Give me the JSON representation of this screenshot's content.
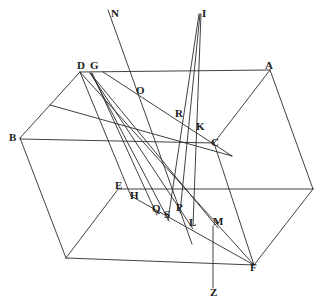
{
  "figure": {
    "kind": "geometric-diagram",
    "width": 329,
    "height": 305,
    "background_color": "#ffffff",
    "stroke_color": "#2b2b2b",
    "label_color": "#1a1a1a",
    "stroke_width": 0.9
  },
  "chart_data": {
    "type": "scatter",
    "title": "",
    "xlabel": "",
    "ylabel": "",
    "grid": false,
    "legend": null,
    "xlim": [
      0,
      329
    ],
    "ylim": [
      0,
      305
    ],
    "note": "Labelled points of the construction, coordinates in image pixel space (y grows downward)",
    "categories": [
      "N",
      "I",
      "D",
      "G",
      "A",
      "O",
      "R",
      "K",
      "C",
      "B",
      "E",
      "H",
      "Q",
      "S",
      "P",
      "L",
      "M",
      "F",
      "Z"
    ],
    "values": [
      {
        "name": "N",
        "x": 112,
        "y": 14
      },
      {
        "name": "I",
        "x": 202,
        "y": 14
      },
      {
        "name": "D",
        "x": 82,
        "y": 66
      },
      {
        "name": "G",
        "x": 95,
        "y": 66
      },
      {
        "name": "A",
        "x": 270,
        "y": 66
      },
      {
        "name": "O",
        "x": 140,
        "y": 91
      },
      {
        "name": "R",
        "x": 180,
        "y": 114
      },
      {
        "name": "K",
        "x": 199,
        "y": 128
      },
      {
        "name": "C",
        "x": 214,
        "y": 143
      },
      {
        "name": "B",
        "x": 16,
        "y": 139
      },
      {
        "name": "E",
        "x": 120,
        "y": 186
      },
      {
        "name": "H",
        "x": 134,
        "y": 197
      },
      {
        "name": "Q",
        "x": 157,
        "y": 210
      },
      {
        "name": "S",
        "x": 168,
        "y": 216
      },
      {
        "name": "P",
        "x": 180,
        "y": 209
      },
      {
        "name": "L",
        "x": 193,
        "y": 224
      },
      {
        "name": "M",
        "x": 218,
        "y": 223
      },
      {
        "name": "F",
        "x": 254,
        "y": 268
      },
      {
        "name": "Z",
        "x": 214,
        "y": 294
      }
    ]
  },
  "labels": [
    {
      "id": "label-n",
      "text": "N",
      "x": 111,
      "y": 8,
      "name": "point-label-n"
    },
    {
      "id": "label-i",
      "text": "I",
      "x": 202,
      "y": 8,
      "name": "point-label-i"
    },
    {
      "id": "label-d",
      "text": "D",
      "x": 77,
      "y": 60,
      "name": "point-label-d"
    },
    {
      "id": "label-g",
      "text": "G",
      "x": 90,
      "y": 60,
      "name": "point-label-g"
    },
    {
      "id": "label-a",
      "text": "A",
      "x": 265,
      "y": 60,
      "name": "point-label-a"
    },
    {
      "id": "label-o",
      "text": "O",
      "x": 136,
      "y": 85,
      "name": "point-label-o"
    },
    {
      "id": "label-r",
      "text": "R",
      "x": 175,
      "y": 108,
      "name": "point-label-r"
    },
    {
      "id": "label-k",
      "text": "K",
      "x": 196,
      "y": 121,
      "name": "point-label-k"
    },
    {
      "id": "label-c",
      "text": "C",
      "x": 211,
      "y": 137,
      "name": "point-label-c"
    },
    {
      "id": "label-b",
      "text": "B",
      "x": 9,
      "y": 132,
      "name": "point-label-b"
    },
    {
      "id": "label-e",
      "text": "E",
      "x": 115,
      "y": 180,
      "name": "point-label-e"
    },
    {
      "id": "label-h",
      "text": "H",
      "x": 130,
      "y": 190,
      "name": "point-label-h"
    },
    {
      "id": "label-q",
      "text": "Q",
      "x": 152,
      "y": 203,
      "name": "point-label-q"
    },
    {
      "id": "label-s",
      "text": "S",
      "x": 164,
      "y": 209,
      "name": "point-label-s"
    },
    {
      "id": "label-p",
      "text": "P",
      "x": 176,
      "y": 202,
      "name": "point-label-p"
    },
    {
      "id": "label-l",
      "text": "L",
      "x": 189,
      "y": 217,
      "name": "point-label-l"
    },
    {
      "id": "label-m",
      "text": "M",
      "x": 213,
      "y": 216,
      "name": "point-label-m"
    },
    {
      "id": "label-f",
      "text": "F",
      "x": 250,
      "y": 262,
      "name": "point-label-f"
    },
    {
      "id": "label-z",
      "text": "Z",
      "x": 210,
      "y": 287,
      "name": "point-label-z"
    }
  ],
  "segments": [
    {
      "name": "edge-d-a",
      "x1": 80,
      "y1": 72,
      "x2": 270,
      "y2": 70
    },
    {
      "name": "edge-d-b",
      "x1": 80,
      "y1": 72,
      "x2": 20,
      "y2": 138
    },
    {
      "name": "edge-b-bottomleft",
      "x1": 20,
      "y1": 138,
      "x2": 66,
      "y2": 258
    },
    {
      "name": "edge-b-c",
      "x1": 20,
      "y1": 139,
      "x2": 214,
      "y2": 143
    },
    {
      "name": "edge-bottomleft-f",
      "x1": 66,
      "y1": 258,
      "x2": 254,
      "y2": 265
    },
    {
      "name": "edge-bottomleft-e",
      "x1": 66,
      "y1": 258,
      "x2": 119,
      "y2": 188
    },
    {
      "name": "edge-e-rightmid",
      "x1": 119,
      "y1": 189,
      "x2": 313,
      "y2": 189
    },
    {
      "name": "edge-a-rightmid",
      "x1": 270,
      "y1": 70,
      "x2": 313,
      "y2": 189
    },
    {
      "name": "edge-a-c",
      "x1": 270,
      "y1": 70,
      "x2": 214,
      "y2": 143
    },
    {
      "name": "edge-c-f",
      "x1": 214,
      "y1": 143,
      "x2": 254,
      "y2": 265
    },
    {
      "name": "edge-f-rightmid",
      "x1": 254,
      "y1": 265,
      "x2": 313,
      "y2": 189
    },
    {
      "name": "edge-d-f-diagonal",
      "x1": 80,
      "y1": 72,
      "x2": 254,
      "y2": 265
    },
    {
      "name": "line-g-m",
      "x1": 90,
      "y1": 73,
      "x2": 218,
      "y2": 228
    },
    {
      "name": "line-g-l",
      "x1": 90,
      "y1": 73,
      "x2": 193,
      "y2": 229
    },
    {
      "name": "line-g-s",
      "x1": 91,
      "y1": 73,
      "x2": 169,
      "y2": 221
    },
    {
      "name": "line-g-q",
      "x1": 92,
      "y1": 73,
      "x2": 157,
      "y2": 215
    },
    {
      "name": "line-n-down",
      "x1": 108,
      "y1": 10,
      "x2": 192,
      "y2": 244
    },
    {
      "name": "line-i-left",
      "x1": 199,
      "y1": 14,
      "x2": 168,
      "y2": 220
    },
    {
      "name": "line-i-right",
      "x1": 201,
      "y1": 14,
      "x2": 193,
      "y2": 226
    },
    {
      "name": "line-i-mid",
      "x1": 200,
      "y1": 14,
      "x2": 180,
      "y2": 213
    },
    {
      "name": "line-z-vertical",
      "x1": 213,
      "y1": 226,
      "x2": 213,
      "y2": 288
    },
    {
      "name": "line-h-f",
      "x1": 131,
      "y1": 196,
      "x2": 254,
      "y2": 265
    },
    {
      "name": "line-d-h",
      "x1": 80,
      "y1": 72,
      "x2": 131,
      "y2": 196
    },
    {
      "name": "line-o-c-ray",
      "x1": 103,
      "y1": 72,
      "x2": 232,
      "y2": 156
    },
    {
      "name": "line-b-o-extend",
      "x1": 50,
      "y1": 105,
      "x2": 232,
      "y2": 156
    }
  ]
}
